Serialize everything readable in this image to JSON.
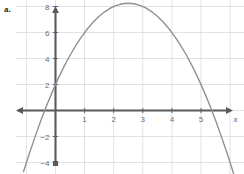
{
  "part": {
    "label": "a."
  },
  "colors": {
    "grid": "#d9dbe0",
    "axis": "#58595b",
    "curve": "#8d8f93",
    "tick_text": "#6d6e71",
    "label_text": "#231f20",
    "background": "#ffffff"
  },
  "chart_data": {
    "type": "line",
    "title": "",
    "subtitle": "",
    "xlabel": "x",
    "ylabel": "y",
    "curve_label": "f(x)",
    "grid": true,
    "legend_position": "inline-annotation",
    "xlim": [
      -1.1,
      6.3
    ],
    "ylim": [
      -5.4,
      9.6
    ],
    "x_ticks": [
      1,
      2,
      3,
      4,
      5
    ],
    "y_ticks": [
      8,
      6,
      4,
      2,
      -2,
      -4
    ],
    "x_tick_labels": [
      "1",
      "2",
      "3",
      "4",
      "5"
    ],
    "y_tick_labels": [
      "8",
      "6",
      "4",
      "2",
      "−2",
      "−4"
    ],
    "grid_x": [
      -1,
      0,
      1,
      2,
      3,
      4,
      5,
      6
    ],
    "grid_y": [
      -4,
      -2,
      0,
      2,
      4,
      6,
      8
    ],
    "equation": "f(x) = -x^2 + 5x + 2",
    "vertex": [
      2.5,
      8.25
    ],
    "y_intercept": 2,
    "roots": [
      -0.372,
      5.372
    ],
    "series": [
      {
        "name": "f(x)",
        "x": [
          -1.1,
          -0.9,
          -0.7,
          -0.5,
          -0.3,
          -0.1,
          0.1,
          0.3,
          0.5,
          0.7,
          0.9,
          1.1,
          1.3,
          1.5,
          1.7,
          1.9,
          2.1,
          2.3,
          2.5,
          2.7,
          2.9,
          3.1,
          3.3,
          3.5,
          3.7,
          3.9,
          4.1,
          4.3,
          4.5,
          4.7,
          4.9,
          5.1,
          5.3,
          5.5,
          5.7,
          5.9,
          6.1,
          6.3
        ],
        "y": [
          -4.71,
          -3.31,
          -2.01,
          -0.75,
          0.41,
          1.49,
          2.49,
          3.41,
          4.25,
          5.01,
          5.69,
          6.29,
          6.81,
          7.25,
          7.61,
          7.89,
          8.09,
          8.21,
          8.25,
          8.21,
          8.09,
          7.89,
          7.61,
          7.25,
          6.81,
          6.29,
          5.69,
          5.01,
          4.25,
          3.41,
          2.49,
          1.49,
          0.41,
          -0.75,
          -2.01,
          -3.31,
          -4.71,
          -6.19
        ]
      }
    ],
    "annotations": [
      {
        "text": "f(x)",
        "x": 2.45,
        "y": 9.2
      },
      {
        "text": "y",
        "x": 0.27,
        "y": 9.25
      },
      {
        "text": "x",
        "x": 6.12,
        "y": -0.85
      }
    ]
  }
}
